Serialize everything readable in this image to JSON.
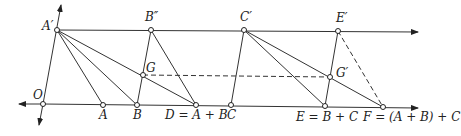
{
  "diagram": {
    "labels": {
      "A_prime": "A′",
      "B_dprime": "B″",
      "C_prime": "C′",
      "E_prime": "E′",
      "G": "G",
      "G_prime": "G′",
      "O": "O",
      "A": "A",
      "B": "B",
      "D": "D = A + B",
      "C": "C",
      "E": "E = B + C",
      "F": "F = (A + B) + C"
    },
    "points": {
      "O": [
        43,
        104
      ],
      "A_prime": [
        57,
        30
      ],
      "A": [
        103,
        105
      ],
      "B": [
        137,
        105
      ],
      "D": [
        196,
        105
      ],
      "C": [
        231,
        105
      ],
      "E": [
        325,
        106
      ],
      "F": [
        383,
        107
      ],
      "B_dprime": [
        151,
        30
      ],
      "C_prime": [
        244,
        30
      ],
      "E_prime": [
        338,
        31
      ],
      "G": [
        143,
        75
      ],
      "G_prime": [
        330,
        77
      ]
    }
  }
}
